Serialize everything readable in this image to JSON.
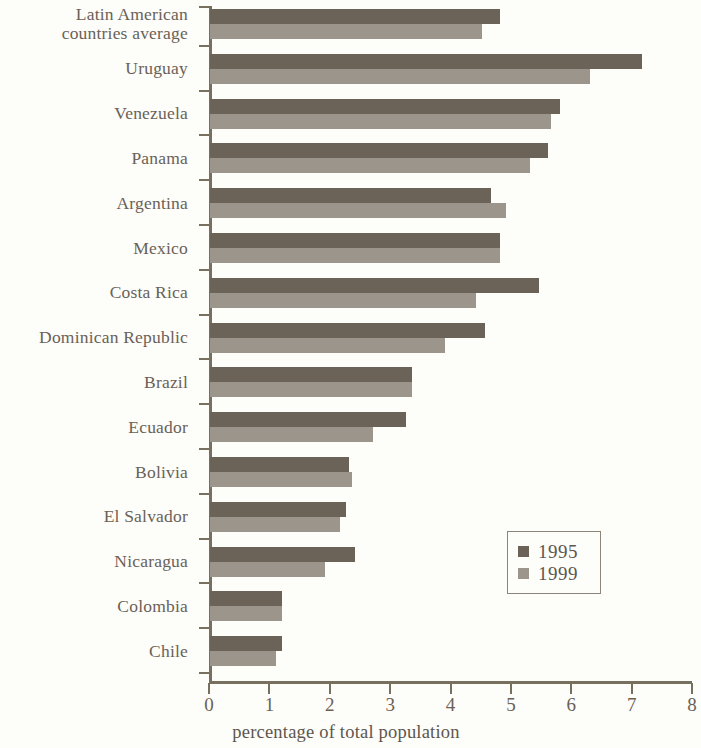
{
  "chart_data": {
    "type": "bar",
    "orientation": "horizontal",
    "title": "",
    "xlabel": "percentage of total population",
    "ylabel": "",
    "xlim": [
      0,
      8
    ],
    "xticks": [
      "0",
      "1",
      "2",
      "3",
      "4",
      "5",
      "6",
      "7",
      "8"
    ],
    "grid": false,
    "legend_position": "inside-right",
    "categories": [
      "Latin American\ncountries average",
      "Uruguay",
      "Venezuela",
      "Panama",
      "Argentina",
      "Mexico",
      "Costa Rica",
      "Dominican Republic",
      "Brazil",
      "Ecuador",
      "Bolivia",
      "El Salvador",
      "Nicaragua",
      "Colombia",
      "Chile"
    ],
    "series": [
      {
        "name": "1995",
        "color": "#6b6258",
        "values": [
          4.8,
          7.15,
          5.8,
          5.6,
          4.65,
          4.8,
          5.45,
          4.55,
          3.35,
          3.25,
          2.3,
          2.25,
          2.4,
          1.2,
          1.2
        ]
      },
      {
        "name": "1999",
        "color": "#9c958b",
        "values": [
          4.5,
          6.3,
          5.65,
          5.3,
          4.9,
          4.8,
          4.4,
          3.9,
          3.35,
          2.7,
          2.35,
          2.15,
          1.9,
          1.2,
          1.1
        ]
      }
    ]
  },
  "colors": {
    "background": "#fdfdfa",
    "axis": "#77705f",
    "label_text": "#6a6157",
    "series_1995": "#6b6258",
    "series_1999": "#9c958b"
  }
}
